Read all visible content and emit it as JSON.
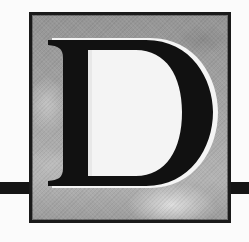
{
  "illustration": {
    "type": "decorative-drop-cap",
    "letter": "D",
    "colors": {
      "letter_fill": "#111111",
      "letter_highlight": "#f4f4f4",
      "frame_border": "#1a1a1a",
      "rule_bar": "#151515",
      "sky_mid": "#a4a4a4",
      "cloud_light": "#d0d0d0",
      "cloud_dark": "#7e7e7e",
      "page_background": "#fbfbfb"
    }
  }
}
